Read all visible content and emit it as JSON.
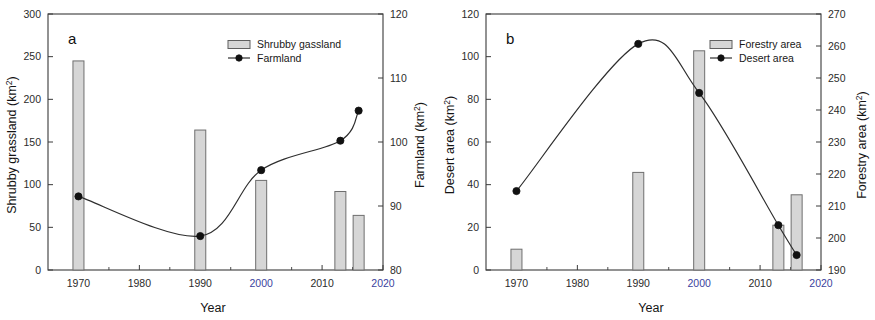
{
  "figure": {
    "panels": [
      "a",
      "b"
    ]
  },
  "panel_a": {
    "letter": "a",
    "xlabel": "Year",
    "left_axis_title": "Shrubby grassland (km",
    "left_axis_sup": "2",
    "left_axis_close": ")",
    "right_axis_title": "Farmland (km",
    "right_axis_sup": "2",
    "right_axis_close": ")",
    "legend": [
      {
        "label": "Shrubby gassland",
        "type": "bar"
      },
      {
        "label": "Farmland",
        "type": "line-marker"
      }
    ],
    "x_ticks": [
      "1970",
      "1980",
      "1990",
      "2000",
      "2010",
      "2020"
    ],
    "left_ticks": [
      "0",
      "50",
      "100",
      "150",
      "200",
      "250",
      "300"
    ],
    "right_ticks": [
      "80",
      "90",
      "100",
      "110",
      "120"
    ]
  },
  "panel_b": {
    "letter": "b",
    "xlabel": "Year",
    "left_axis_title": "Desert area (km",
    "left_axis_sup": "2",
    "left_axis_close": ")",
    "right_axis_title": "Forestry area (km",
    "right_axis_sup": "2",
    "right_axis_close": ")",
    "legend": [
      {
        "label": "Forestry area",
        "type": "bar"
      },
      {
        "label": "Desert area",
        "type": "line-marker"
      }
    ],
    "x_ticks": [
      "1970",
      "1980",
      "1990",
      "2000",
      "2010",
      "2020"
    ],
    "left_ticks": [
      "0",
      "20",
      "40",
      "60",
      "80",
      "100",
      "120"
    ],
    "right_ticks": [
      "190",
      "200",
      "210",
      "220",
      "230",
      "240",
      "250",
      "260",
      "270"
    ]
  },
  "chart_data": [
    {
      "type": "bar",
      "panel": "a",
      "title": "",
      "xlabel": "Year",
      "ylabel": "Shrubby grassland (km2)",
      "y2label": "Farmland (km2)",
      "xlim": [
        1965,
        2020
      ],
      "ylim": [
        0,
        300
      ],
      "y2lim": [
        80,
        120
      ],
      "grid": false,
      "legend_position": "top-right",
      "x": [
        1970,
        1990,
        2000,
        2013,
        2016
      ],
      "series": [
        {
          "name": "Shrubby gassland",
          "kind": "bar",
          "axis": "left",
          "color": "#d6d6d6",
          "x": [
            1970,
            1990,
            2000,
            2013,
            2016
          ],
          "values": [
            245,
            164,
            105,
            92,
            64
          ]
        },
        {
          "name": "Farmland",
          "kind": "line",
          "axis": "right",
          "color": "#111111",
          "x": [
            1970,
            1990,
            2000,
            2013,
            2016
          ],
          "values": [
            91.5,
            85.3,
            95.6,
            100.2,
            104.9
          ]
        }
      ]
    },
    {
      "type": "bar",
      "panel": "b",
      "title": "",
      "xlabel": "Year",
      "ylabel": "Desert area (km2)",
      "y2label": "Forestry area (km2)",
      "xlim": [
        1965,
        2020
      ],
      "ylim": [
        0,
        120
      ],
      "y2lim": [
        190,
        270
      ],
      "grid": false,
      "legend_position": "top-right",
      "x": [
        1970,
        1990,
        2000,
        2013,
        2016
      ],
      "series": [
        {
          "name": "Forestry area",
          "kind": "bar",
          "axis": "right",
          "color": "#d6d6d6",
          "x": [
            1970,
            1990,
            2000,
            2013,
            2016
          ],
          "values": [
            196.5,
            220.5,
            258.5,
            204.0,
            213.5
          ]
        },
        {
          "name": "Desert area",
          "kind": "line",
          "axis": "left",
          "color": "#111111",
          "x": [
            1970,
            1990,
            2000,
            2013,
            2016
          ],
          "values": [
            37,
            106,
            83,
            21,
            7
          ]
        }
      ]
    }
  ]
}
